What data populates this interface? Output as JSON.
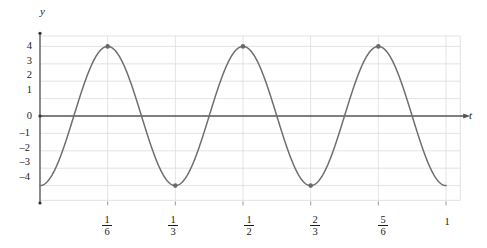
{
  "chart_data": {
    "type": "line",
    "title": "",
    "xlabel": "t",
    "ylabel": "y",
    "grid": true,
    "legend": null,
    "xlim": [
      0,
      1.06
    ],
    "ylim": [
      -4.7,
      4.7
    ],
    "function": "y = -4 cos(6πt)",
    "amplitude": 4,
    "period": 0.3333333,
    "series": [
      {
        "name": "y",
        "color": "#6e6e6e",
        "points_t": [
          0,
          0.0833333,
          0.1666667,
          0.25,
          0.3333333,
          0.4166667,
          0.5,
          0.5833333,
          0.6666667,
          0.75,
          0.8333333,
          0.9166667,
          1.0
        ],
        "points_y": [
          -4,
          0,
          4,
          0,
          -4,
          0,
          4,
          0,
          -4,
          0,
          4,
          0,
          -4
        ]
      }
    ],
    "markers": [
      {
        "t": 0.1666667,
        "y": 4,
        "label": "1/6"
      },
      {
        "t": 0.3333333,
        "y": -4,
        "label": "1/3"
      },
      {
        "t": 0.5,
        "y": 4,
        "label": "1/2"
      },
      {
        "t": 0.6666667,
        "y": -4,
        "label": "2/3"
      },
      {
        "t": 0.8333333,
        "y": 4,
        "label": "5/6"
      }
    ],
    "y_ticks": [
      {
        "value": 4,
        "label": "4"
      },
      {
        "value": 3,
        "label": "3"
      },
      {
        "value": 2,
        "label": "2"
      },
      {
        "value": 1,
        "label": "1"
      },
      {
        "value": 0,
        "label": "0"
      },
      {
        "value": -1,
        "label": "–1"
      },
      {
        "value": -2,
        "label": "–2"
      },
      {
        "value": -3,
        "label": "–3"
      },
      {
        "value": -4,
        "label": "–4"
      }
    ],
    "x_ticks": [
      {
        "value": 0.1666667,
        "numerator": "1",
        "denominator": "6",
        "label": "1/6"
      },
      {
        "value": 0.3333333,
        "numerator": "1",
        "denominator": "3",
        "label": "1/3"
      },
      {
        "value": 0.5,
        "numerator": "1",
        "denominator": "2",
        "label": "1/2"
      },
      {
        "value": 0.6666667,
        "numerator": "2",
        "denominator": "3",
        "label": "2/3"
      },
      {
        "value": 0.8333333,
        "numerator": "5",
        "denominator": "6",
        "label": "5/6"
      },
      {
        "value": 1.0,
        "numerator": "",
        "denominator": "",
        "label": "1"
      }
    ],
    "colors": {
      "curve": "#6e6e6e",
      "axis": "#555555",
      "grid": "#dcdcdc",
      "marker": "#6a6a6a",
      "text": "#1a1a1a"
    }
  },
  "axes": {
    "y_axis_label": "y",
    "t_axis_label": "t"
  },
  "y_tick_labels": {
    "0": "4",
    "1": "3",
    "2": "2",
    "3": "1",
    "4": "0",
    "5": "–1",
    "6": "–2",
    "7": "–3",
    "8": "–4"
  },
  "x_tick_labels": {
    "t1_num": "1",
    "t1_den": "6",
    "t2_num": "1",
    "t2_den": "3",
    "t3_num": "1",
    "t3_den": "2",
    "t4_num": "2",
    "t4_den": "3",
    "t5_num": "5",
    "t5_den": "6",
    "t6": "1"
  }
}
